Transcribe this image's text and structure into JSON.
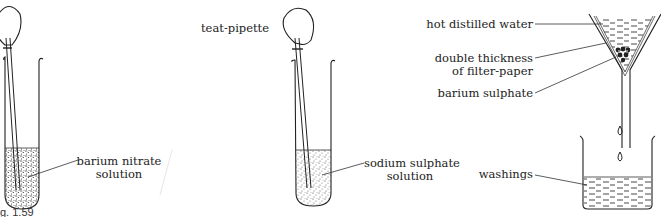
{
  "figure": {
    "caption": "g. 1.59",
    "panels": [
      {
        "id": "panel-1",
        "labels": {
          "solution_line1": "barium nitrate",
          "solution_line2": "solution"
        }
      },
      {
        "id": "panel-2",
        "labels": {
          "pipette": "teat-pipette",
          "solution_line1": "sodium sulphate",
          "solution_line2": "solution"
        }
      },
      {
        "id": "panel-3",
        "labels": {
          "water": "hot distilled water",
          "filter_line1": "double thickness",
          "filter_line2": "of filter-paper",
          "precipitate": "barium sulphate",
          "washings": "washings"
        }
      }
    ]
  }
}
